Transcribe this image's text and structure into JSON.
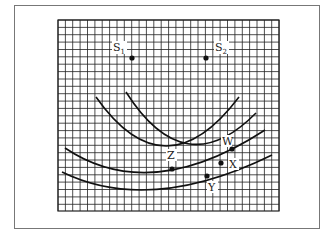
{
  "figure": {
    "type": "wave interference diagram on grid",
    "grid": {
      "left": 58,
      "top": 20,
      "right": 279,
      "bottom": 211,
      "spacing": 7.37,
      "color": "#222222"
    },
    "sources": [
      {
        "label": "S",
        "sub": "1",
        "dot": [
          132,
          58
        ],
        "label_pos": [
          113,
          51
        ]
      },
      {
        "label": "S",
        "sub": "2",
        "dot": [
          206,
          58
        ],
        "label_pos": [
          215,
          51
        ]
      }
    ],
    "curves": [
      {
        "name": "wavefront-1",
        "path": "M96,97 Q165,195 239,97"
      },
      {
        "name": "wavefront-2",
        "path": "M126,92 Q185,185 256,113"
      },
      {
        "name": "wavefront-3",
        "path": "M65,148 Q150,205 265,130"
      },
      {
        "name": "wavefront-4",
        "path": "M62,172 Q150,215 272,155"
      }
    ],
    "points": [
      {
        "label": "Z",
        "dot": [
          172,
          169
        ],
        "label_pos": [
          167,
          159
        ]
      },
      {
        "label": "W",
        "dot": [
          232,
          149
        ],
        "label_pos": [
          222,
          145
        ]
      },
      {
        "label": "X",
        "dot": [
          221,
          163
        ],
        "label_pos": [
          229,
          168
        ]
      },
      {
        "label": "Y",
        "dot": [
          207,
          176
        ],
        "label_pos": [
          208,
          191
        ]
      }
    ]
  }
}
